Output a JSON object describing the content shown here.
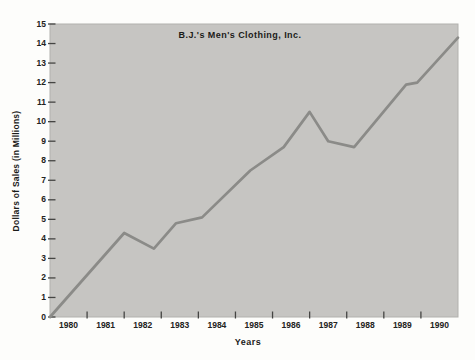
{
  "page": {
    "background": "#ffffff"
  },
  "chart_data": {
    "type": "line",
    "title": "B.J.'s Men's Clothing, Inc.",
    "xlabel": "Years",
    "ylabel": "Dollars of Sales (in Millions)",
    "xlim": [
      1980,
      1991
    ],
    "ylim": [
      0,
      15
    ],
    "x_tick_labels": [
      "1980",
      "1981",
      "1982",
      "1983",
      "1984",
      "1985",
      "1986",
      "1987",
      "1988",
      "1989",
      "1990"
    ],
    "y_tick_labels": [
      "0",
      "1",
      "2",
      "3",
      "4",
      "5",
      "6",
      "7",
      "8",
      "9",
      "10",
      "11",
      "12",
      "13",
      "14",
      "15"
    ],
    "grid": "off",
    "legend": "none",
    "series": [
      {
        "name": "Dollars of Sales",
        "points": [
          [
            1980.0,
            0.0
          ],
          [
            1982.0,
            4.3
          ],
          [
            1982.8,
            3.5
          ],
          [
            1983.4,
            4.8
          ],
          [
            1984.1,
            5.1
          ],
          [
            1985.4,
            7.5
          ],
          [
            1986.3,
            8.7
          ],
          [
            1987.0,
            10.5
          ],
          [
            1987.5,
            9.0
          ],
          [
            1988.2,
            8.7
          ],
          [
            1989.6,
            11.9
          ],
          [
            1989.9,
            12.0
          ],
          [
            1991.0,
            14.3
          ]
        ]
      }
    ],
    "colors": {
      "plot_background": "#c6c5c2",
      "plot_border": "#b2b1ae",
      "line": "#8b8b88",
      "tick_marks": "#454543",
      "text": "#1b1b19"
    }
  }
}
